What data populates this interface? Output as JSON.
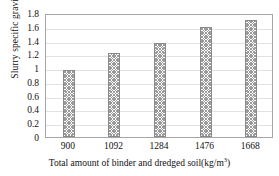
{
  "chart_data": {
    "type": "bar",
    "title": "",
    "xlabel": "Total amount of binder and dredged soil(kg/m³)",
    "xlabel_base": "Total amount of binder and dredged soil(kg/m",
    "xlabel_sup": "3",
    "xlabel_tail": ")",
    "ylabel": "Slurry specific gravity",
    "categories": [
      "900",
      "1092",
      "1284",
      "1476",
      "1668"
    ],
    "values": [
      0.97,
      1.22,
      1.36,
      1.6,
      1.7
    ],
    "ylim": [
      0,
      1.8
    ],
    "ytick_labels": [
      "0",
      "0.2",
      "0.4",
      "0.6",
      "0.8",
      "1",
      "1.2",
      "1.4",
      "1.6",
      "1.8"
    ],
    "ytick_values": [
      0,
      0.2,
      0.4,
      0.6,
      0.8,
      1,
      1.2,
      1.4,
      1.6,
      1.8
    ],
    "grid": true,
    "grid_axis": "y",
    "legend": "none",
    "bar_fill": "crosshatch-pattern",
    "bar_fill_color": "#9a9a9a",
    "bar_edge_color": "#8a8a8a",
    "grid_color": "#e2e2e2",
    "frame_color": "#a6a6a6",
    "background": "#ffffff",
    "text_color": "#111111"
  }
}
